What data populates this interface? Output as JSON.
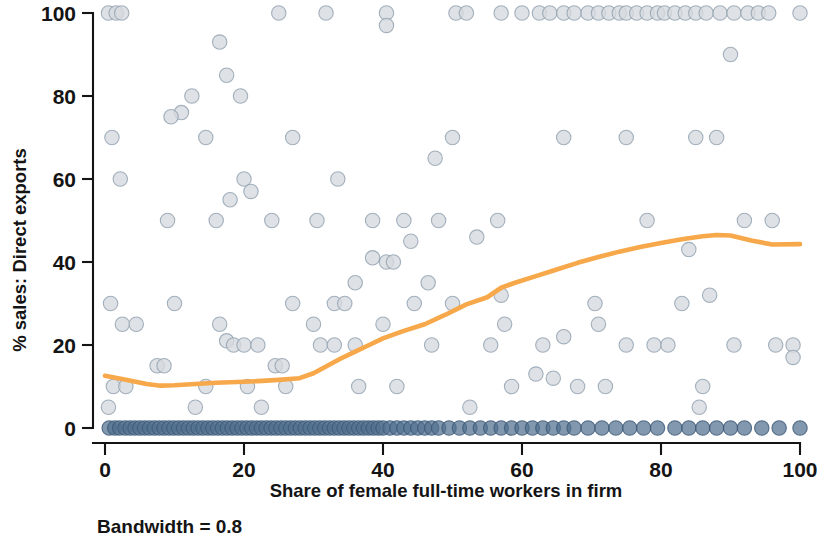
{
  "figure": {
    "note": "Bandwidth = 0.8",
    "marker_fill": "#d6dade",
    "marker_stroke": "#9aa7b4",
    "marker_fill_dark": "#5b7architecture",
    "axis_color": "#141414",
    "line_color": "#f7a84a"
  },
  "chart_data": {
    "type": "scatter",
    "title": "",
    "subtitle": "",
    "xlabel": "Share of female full-time workers in firm",
    "ylabel": "% sales: Direct exports",
    "annotation": "Bandwidth = 0.8",
    "xlim": [
      0,
      100
    ],
    "ylim": [
      0,
      100
    ],
    "xticks": [
      0,
      20,
      40,
      60,
      80,
      100
    ],
    "yticks": [
      0,
      20,
      40,
      60,
      80,
      100
    ],
    "xtick_labels": [
      "0",
      "20",
      "40",
      "60",
      "80",
      "100"
    ],
    "ytick_labels": [
      "0",
      "20",
      "40",
      "60",
      "80",
      "100"
    ],
    "grid": false,
    "legend": false,
    "legend_position": "none",
    "marker_color": "#d6dade",
    "marker_edge_color": "#94a3b2",
    "marker_dense_color": "#51708f",
    "line_color": "#f7a84a",
    "series": [
      {
        "name": "Firms",
        "type": "scatter",
        "points": [
          [
            0.5,
            100
          ],
          [
            1.6,
            100
          ],
          [
            2.4,
            100
          ],
          [
            25.0,
            100
          ],
          [
            31.8,
            100
          ],
          [
            40.5,
            100
          ],
          [
            40.5,
            97
          ],
          [
            50.5,
            100
          ],
          [
            52.0,
            100
          ],
          [
            57.0,
            100
          ],
          [
            60.0,
            100
          ],
          [
            62.5,
            100
          ],
          [
            64.0,
            100
          ],
          [
            66.0,
            100
          ],
          [
            67.5,
            100
          ],
          [
            69.5,
            100
          ],
          [
            71.0,
            100
          ],
          [
            72.5,
            100
          ],
          [
            74.0,
            100
          ],
          [
            75.0,
            100
          ],
          [
            76.5,
            100
          ],
          [
            78.0,
            100
          ],
          [
            79.5,
            100
          ],
          [
            80.5,
            100
          ],
          [
            82.0,
            100
          ],
          [
            83.5,
            100
          ],
          [
            85.0,
            100
          ],
          [
            86.5,
            100
          ],
          [
            88.5,
            100
          ],
          [
            90.5,
            100
          ],
          [
            92.5,
            100
          ],
          [
            94.0,
            100
          ],
          [
            95.5,
            100
          ],
          [
            100.0,
            100
          ],
          [
            16.5,
            93
          ],
          [
            17.5,
            85
          ],
          [
            12.5,
            80
          ],
          [
            19.5,
            80
          ],
          [
            11.0,
            76
          ],
          [
            9.5,
            75
          ],
          [
            14.5,
            70
          ],
          [
            1.0,
            70
          ],
          [
            27.0,
            70
          ],
          [
            50.0,
            70
          ],
          [
            66.0,
            70
          ],
          [
            75.0,
            70
          ],
          [
            85.0,
            70
          ],
          [
            88.0,
            70
          ],
          [
            90.0,
            90
          ],
          [
            2.2,
            60
          ],
          [
            20.0,
            60
          ],
          [
            21.0,
            57
          ],
          [
            33.5,
            60
          ],
          [
            47.5,
            65
          ],
          [
            18.0,
            55
          ],
          [
            9.0,
            50
          ],
          [
            16.0,
            50
          ],
          [
            24.0,
            50
          ],
          [
            30.5,
            50
          ],
          [
            38.5,
            50
          ],
          [
            43.0,
            50
          ],
          [
            48.0,
            50
          ],
          [
            56.5,
            50
          ],
          [
            78.0,
            50
          ],
          [
            92.0,
            50
          ],
          [
            96.0,
            50
          ],
          [
            44.0,
            45
          ],
          [
            53.5,
            46
          ],
          [
            38.5,
            41
          ],
          [
            40.5,
            40
          ],
          [
            41.5,
            40
          ],
          [
            84.0,
            43
          ],
          [
            36.0,
            35
          ],
          [
            46.5,
            35
          ],
          [
            57.0,
            32
          ],
          [
            87.0,
            32
          ],
          [
            0.8,
            30
          ],
          [
            10.0,
            30
          ],
          [
            27.0,
            30
          ],
          [
            33.0,
            30
          ],
          [
            34.5,
            30
          ],
          [
            44.5,
            30
          ],
          [
            50.0,
            30
          ],
          [
            70.5,
            30
          ],
          [
            83.0,
            30
          ],
          [
            2.5,
            25
          ],
          [
            4.5,
            25
          ],
          [
            16.5,
            25
          ],
          [
            30.0,
            25
          ],
          [
            40.0,
            25
          ],
          [
            57.5,
            25
          ],
          [
            66.0,
            22
          ],
          [
            71.0,
            25
          ],
          [
            79.0,
            20
          ],
          [
            81.0,
            20
          ],
          [
            96.5,
            20
          ],
          [
            99.0,
            20
          ],
          [
            99.0,
            17
          ],
          [
            17.5,
            21
          ],
          [
            18.5,
            20
          ],
          [
            20.0,
            20
          ],
          [
            22.0,
            20
          ],
          [
            31.0,
            20
          ],
          [
            33.0,
            20
          ],
          [
            36.0,
            20
          ],
          [
            47.0,
            20
          ],
          [
            55.5,
            20
          ],
          [
            63.0,
            20
          ],
          [
            75.0,
            20
          ],
          [
            90.5,
            20
          ],
          [
            24.5,
            15
          ],
          [
            25.5,
            15
          ],
          [
            7.5,
            15
          ],
          [
            8.5,
            15
          ],
          [
            1.2,
            10
          ],
          [
            3.0,
            10
          ],
          [
            14.5,
            10
          ],
          [
            20.5,
            10
          ],
          [
            26.0,
            10
          ],
          [
            36.5,
            10
          ],
          [
            42.0,
            10
          ],
          [
            58.5,
            10
          ],
          [
            62.0,
            13
          ],
          [
            64.5,
            12
          ],
          [
            68.0,
            10
          ],
          [
            72.0,
            10
          ],
          [
            86.0,
            10
          ],
          [
            0.5,
            5
          ],
          [
            13.0,
            5
          ],
          [
            22.5,
            5
          ],
          [
            52.5,
            5
          ],
          [
            85.5,
            5
          ],
          [
            0.6,
            0
          ],
          [
            1.4,
            0
          ],
          [
            2.1,
            0
          ],
          [
            2.9,
            0
          ],
          [
            3.6,
            0
          ],
          [
            4.3,
            0
          ],
          [
            5.0,
            0
          ],
          [
            5.7,
            0
          ],
          [
            6.4,
            0
          ],
          [
            7.1,
            0
          ],
          [
            7.8,
            0
          ],
          [
            8.5,
            0
          ],
          [
            9.2,
            0
          ],
          [
            9.9,
            0
          ],
          [
            10.6,
            0
          ],
          [
            11.3,
            0
          ],
          [
            12.0,
            0
          ],
          [
            12.7,
            0
          ],
          [
            13.4,
            0
          ],
          [
            14.1,
            0
          ],
          [
            14.8,
            0
          ],
          [
            15.5,
            0
          ],
          [
            16.2,
            0
          ],
          [
            16.9,
            0
          ],
          [
            17.6,
            0
          ],
          [
            18.3,
            0
          ],
          [
            19.0,
            0
          ],
          [
            19.7,
            0
          ],
          [
            20.4,
            0
          ],
          [
            21.1,
            0
          ],
          [
            21.8,
            0
          ],
          [
            22.5,
            0
          ],
          [
            23.2,
            0
          ],
          [
            23.9,
            0
          ],
          [
            24.6,
            0
          ],
          [
            25.3,
            0
          ],
          [
            26.0,
            0
          ],
          [
            26.7,
            0
          ],
          [
            27.4,
            0
          ],
          [
            28.1,
            0
          ],
          [
            28.8,
            0
          ],
          [
            29.5,
            0
          ],
          [
            30.2,
            0
          ],
          [
            30.9,
            0
          ],
          [
            31.6,
            0
          ],
          [
            32.3,
            0
          ],
          [
            33.0,
            0
          ],
          [
            33.7,
            0
          ],
          [
            34.4,
            0
          ],
          [
            35.1,
            0
          ],
          [
            35.8,
            0
          ],
          [
            36.5,
            0
          ],
          [
            37.2,
            0
          ],
          [
            37.9,
            0
          ],
          [
            38.6,
            0
          ],
          [
            39.3,
            0
          ],
          [
            40.0,
            0
          ],
          [
            41.0,
            0
          ],
          [
            42.0,
            0
          ],
          [
            43.0,
            0
          ],
          [
            44.0,
            0
          ],
          [
            45.0,
            0
          ],
          [
            46.0,
            0
          ],
          [
            47.0,
            0
          ],
          [
            48.0,
            0
          ],
          [
            49.5,
            0
          ],
          [
            51.0,
            0
          ],
          [
            52.5,
            0
          ],
          [
            54.0,
            0
          ],
          [
            55.5,
            0
          ],
          [
            57.0,
            0
          ],
          [
            58.5,
            0
          ],
          [
            60.0,
            0
          ],
          [
            61.5,
            0
          ],
          [
            63.0,
            0
          ],
          [
            64.5,
            0
          ],
          [
            66.0,
            0
          ],
          [
            67.5,
            0
          ],
          [
            69.5,
            0
          ],
          [
            71.5,
            0
          ],
          [
            73.5,
            0
          ],
          [
            75.5,
            0
          ],
          [
            77.5,
            0
          ],
          [
            79.5,
            0
          ],
          [
            82.0,
            0
          ],
          [
            84.0,
            0
          ],
          [
            86.0,
            0
          ],
          [
            88.0,
            0
          ],
          [
            90.0,
            0
          ],
          [
            92.0,
            0
          ],
          [
            94.5,
            0
          ],
          [
            97.0,
            0
          ],
          [
            100.0,
            0
          ]
        ]
      },
      {
        "name": "Lowess smoother",
        "type": "line",
        "x": [
          0,
          3,
          6,
          8,
          10,
          13,
          16,
          19,
          22,
          25,
          28,
          30,
          32,
          34,
          36,
          38,
          40,
          43,
          46,
          49,
          52,
          55,
          57,
          59,
          62,
          65,
          68,
          71,
          74,
          77,
          80,
          83,
          86,
          88,
          90,
          93,
          96,
          100
        ],
        "y": [
          12.6,
          11.6,
          10.6,
          10.2,
          10.3,
          10.6,
          10.9,
          11.1,
          11.3,
          11.6,
          12.0,
          13.2,
          15.0,
          16.8,
          18.4,
          20.0,
          21.6,
          23.4,
          25.0,
          27.3,
          29.8,
          31.5,
          33.8,
          35.0,
          36.6,
          38.2,
          39.8,
          41.2,
          42.5,
          43.6,
          44.6,
          45.5,
          46.2,
          46.5,
          46.4,
          45.2,
          44.2,
          44.3
        ]
      }
    ]
  }
}
